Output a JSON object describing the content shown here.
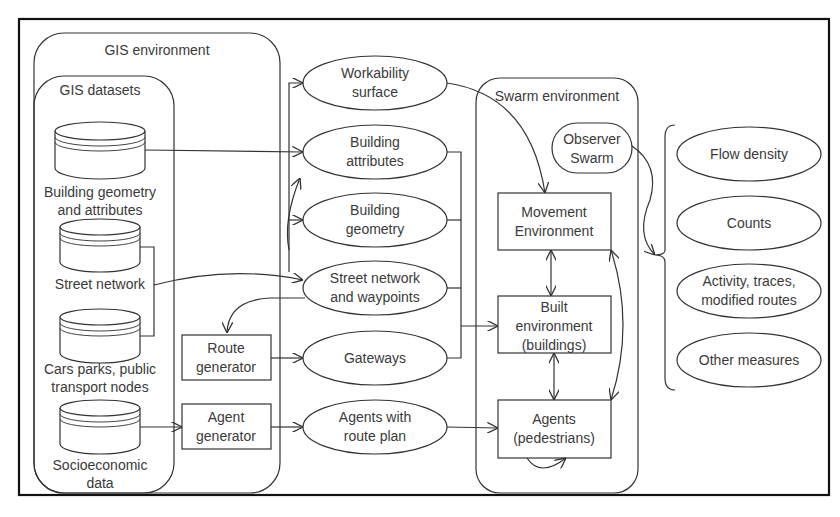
{
  "containers": {
    "gis_environment": "GIS environment",
    "gis_datasets": "GIS datasets",
    "swarm_environment": "Swarm environment"
  },
  "datasets": [
    {
      "line1": "Building geometry",
      "line2": "and attributes"
    },
    {
      "line1": "Street network",
      "line2": ""
    },
    {
      "line1": "Cars parks, public",
      "line2": "transport nodes"
    },
    {
      "line1": "Socioeconomic",
      "line2": "data"
    }
  ],
  "generators": [
    {
      "line1": "Route",
      "line2": "generator"
    },
    {
      "line1": "Agent",
      "line2": "generator"
    }
  ],
  "layers": [
    {
      "line1": "Workability",
      "line2": "surface"
    },
    {
      "line1": "Building",
      "line2": "attributes"
    },
    {
      "line1": "Building",
      "line2": "geometry"
    },
    {
      "line1": "Street network",
      "line2": "and waypoints"
    },
    {
      "line1": "Gateways",
      "line2": ""
    },
    {
      "line1": "Agents with",
      "line2": "route plan"
    }
  ],
  "swarm": {
    "observer": {
      "line1": "Observer",
      "line2": "Swarm"
    },
    "movement": {
      "line1": "Movement",
      "line2": "Environment"
    },
    "built": {
      "line1": "Built",
      "line2": "environment",
      "line3": "(buildings)"
    },
    "agents": {
      "line1": "Agents",
      "line2": "(pedestrians)"
    }
  },
  "outputs": [
    {
      "line1": "Flow density",
      "line2": ""
    },
    {
      "line1": "Counts",
      "line2": ""
    },
    {
      "line1": "Activity, traces,",
      "line2": "modified routes"
    },
    {
      "line1": "Other measures",
      "line2": ""
    }
  ],
  "colors": {
    "line": "#333333",
    "frame": "#111111",
    "text": "#3a3a3a",
    "background": "#ffffff"
  }
}
